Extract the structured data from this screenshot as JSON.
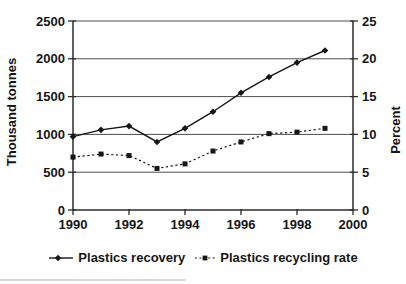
{
  "colors": {
    "series": "#161616",
    "grid": "#4d4d4d",
    "axis": "#2b2b2b",
    "background": "#ffffff",
    "text": "#161616"
  },
  "chart_data": {
    "type": "line",
    "title": "",
    "x": [
      1990,
      1991,
      1992,
      1993,
      1994,
      1995,
      1996,
      1997,
      1998,
      1999
    ],
    "x_ticks": [
      1990,
      1992,
      1994,
      1996,
      1998,
      2000
    ],
    "x_range": [
      1990,
      2000
    ],
    "grid": "horizontal",
    "legend_position": "bottom",
    "left_axis": {
      "label": "Thousand tonnes",
      "ticks": [
        0,
        500,
        1000,
        1500,
        2000,
        2500
      ],
      "range": [
        0,
        2500
      ]
    },
    "right_axis": {
      "label": "Percent",
      "ticks": [
        0,
        5,
        10,
        15,
        20,
        25
      ],
      "range": [
        0,
        25
      ]
    },
    "series": [
      {
        "name": "Plastics recovery",
        "axis": "left",
        "line": "solid",
        "marker": "diamond",
        "values": [
          970,
          1060,
          1110,
          900,
          1080,
          1300,
          1550,
          1760,
          1950,
          2110
        ]
      },
      {
        "name": "Plastics recycling rate",
        "axis": "right",
        "line": "dotted",
        "marker": "square",
        "values": [
          7.0,
          7.4,
          7.2,
          5.5,
          6.1,
          7.8,
          9.0,
          10.1,
          10.3,
          10.8
        ]
      }
    ]
  }
}
